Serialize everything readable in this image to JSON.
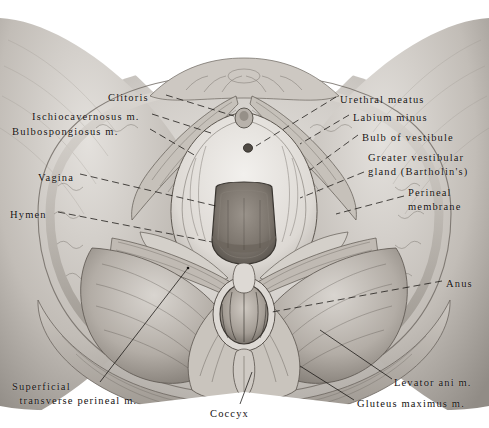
{
  "plate": {
    "title": "Female perineum — superficial and deep dissection",
    "medium": "graphite anatomical illustration",
    "view": "lithotomy position, inferior view",
    "background_color": "#ffffff",
    "ink_color": "#14110f"
  },
  "labels": {
    "left": [
      {
        "name": "clitoris",
        "text": "Clitoris",
        "x": 108,
        "y": 91
      },
      {
        "name": "ischiocavernosus-muscle",
        "text": "Ischiocavernosus m.",
        "x": 32,
        "y": 110
      },
      {
        "name": "bulbospongiosus-muscle",
        "text": "Bulbospongiosus m.",
        "x": 12,
        "y": 125
      },
      {
        "name": "vagina",
        "text": "Vagina",
        "x": 38,
        "y": 171
      },
      {
        "name": "hymen",
        "text": "Hymen",
        "x": 10,
        "y": 208
      }
    ],
    "right": [
      {
        "name": "urethral-meatus",
        "text": "Urethral meatus",
        "x": 340,
        "y": 93
      },
      {
        "name": "labium-minus",
        "text": "Labium minus",
        "x": 353,
        "y": 111
      },
      {
        "name": "bulb-of-vestibule",
        "text": "Bulb of vestibule",
        "x": 362,
        "y": 131
      },
      {
        "name": "greater-vestibular-gland",
        "text": "Greater vestibular\ngland (Bartholin's)",
        "x": 368,
        "y": 151
      },
      {
        "name": "perineal-membrane",
        "text": "Perineal\nmembrane",
        "x": 408,
        "y": 186
      },
      {
        "name": "anus",
        "text": "Anus",
        "x": 446,
        "y": 277
      }
    ],
    "bottom": [
      {
        "name": "superficial-transverse-perineal-muscle",
        "text": "Superficial\n  transverse perineal m.",
        "x": 12,
        "y": 380
      },
      {
        "name": "coccyx",
        "text": "Coccyx",
        "x": 210,
        "y": 407
      },
      {
        "name": "levator-ani-muscle",
        "text": "Levator ani m.",
        "x": 394,
        "y": 376
      },
      {
        "name": "gluteus-maximus-muscle",
        "text": "Gluteus maximus m.",
        "x": 357,
        "y": 397
      }
    ]
  },
  "structures": [
    {
      "name": "mons-pubis",
      "label": "mons pubis"
    },
    {
      "name": "labium-majus",
      "label": "labium majus"
    },
    {
      "name": "vestibule",
      "label": "vestibule"
    },
    {
      "name": "perineal-body",
      "label": "perineal body"
    },
    {
      "name": "ischioanal-fossa",
      "label": "ischioanal fossa"
    },
    {
      "name": "anal-canal",
      "label": "anal canal"
    },
    {
      "name": "thigh-medial",
      "label": "medial thigh"
    },
    {
      "name": "sacrococcygeal-region",
      "label": "sacrococcygeal region"
    }
  ]
}
